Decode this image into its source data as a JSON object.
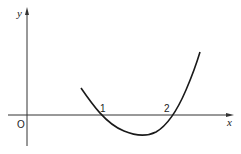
{
  "figure": {
    "axes": {
      "x_label": "x",
      "y_label": "y",
      "origin_label": "O"
    },
    "roots": [
      {
        "value": 1,
        "label": "1"
      },
      {
        "value": 2,
        "label": "2"
      }
    ],
    "curve": {
      "description": "parabola-like curve opening upward, crossing x-axis at 1 and 2",
      "color": "#1a1a1a"
    }
  }
}
